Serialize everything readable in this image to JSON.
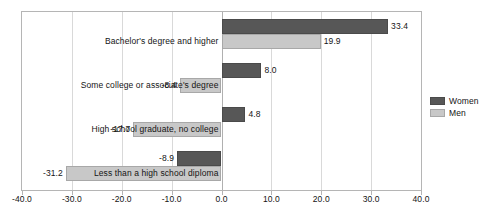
{
  "chart_data": {
    "type": "bar",
    "orientation": "horizontal",
    "title": "",
    "xlabel": "",
    "ylabel": "",
    "xlim": [
      -40.0,
      40.0
    ],
    "grid": true,
    "legend_position": "right",
    "categories": [
      "Bachelor's degree and higher",
      "Some college or associate's degree",
      "High school graduate, no college",
      "Less than a high school diploma"
    ],
    "series": [
      {
        "name": "Women",
        "color": "#575757",
        "values": [
          33.4,
          8.0,
          4.8,
          -8.9
        ],
        "labels": [
          "33.4",
          "8.0",
          "4.8",
          "-8.9"
        ]
      },
      {
        "name": "Men",
        "color": "#c8c8c8",
        "values": [
          19.9,
          -8.4,
          -17.7,
          -31.2
        ],
        "labels": [
          "19.9",
          "-8.4",
          "-17.7",
          "-31.2"
        ]
      }
    ],
    "xticks": [
      -40.0,
      -30.0,
      -20.0,
      -10.0,
      0.0,
      10.0,
      20.0,
      30.0,
      40.0
    ],
    "xtick_labels": [
      "-40.0",
      "-30.0",
      "-20.0",
      "-10.0",
      "0.0",
      "10.0",
      "20.0",
      "30.0",
      "40.0"
    ]
  },
  "legend": {
    "items": [
      {
        "label": "Women"
      },
      {
        "label": "Men"
      }
    ]
  }
}
